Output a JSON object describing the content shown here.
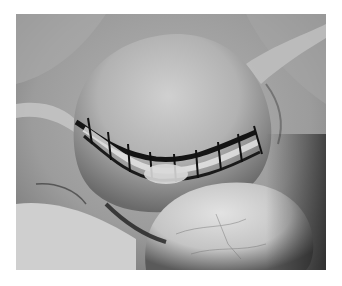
{
  "image": {
    "description": "Grayscale intraoperative photograph of a sutured rounded organ (uterus) with a line of dark sutures across its middle, surrounded by pale tissue and a smooth rounded structure in the lower right foreground",
    "alt": "Surgical photograph showing sutured organ",
    "tones": {
      "background": "#ffffff",
      "tissue_light": "#d6d6d6",
      "tissue_mid": "#9a9a9a",
      "shadow": "#2a2a2a",
      "suture": "#151515"
    }
  }
}
